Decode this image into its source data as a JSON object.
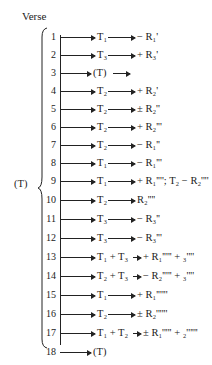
{
  "title": "Verse",
  "group_label": "(T)",
  "rows": [
    {
      "n": "1",
      "term": "T₁",
      "result": "− R₁'"
    },
    {
      "n": "2",
      "term": "T₃",
      "result": "+ R₃'"
    },
    {
      "n": "3",
      "term": "(T)",
      "result": ""
    },
    {
      "n": "4",
      "term": "T₂",
      "result": "+ R₂'"
    },
    {
      "n": "5",
      "term": "T₂",
      "result": "± R₂''"
    },
    {
      "n": "6",
      "term": "T₂",
      "result": "+ R₂'''"
    },
    {
      "n": "7",
      "term": "T₂",
      "result": "− R₁''"
    },
    {
      "n": "8",
      "term": "T₁",
      "result": "− R₁'''"
    },
    {
      "n": "9",
      "term": "T₁",
      "result": "+ R₁''''; T₂ − R₂''''"
    },
    {
      "n": "10",
      "term": "T₂",
      "result": "R₂''''"
    },
    {
      "n": "11",
      "term": "T₃",
      "result": "− R₃''"
    },
    {
      "n": "12",
      "term": "T₃",
      "result": "− R₃'''"
    },
    {
      "n": "13",
      "term": "T₁ + T₃",
      "result": "+ R₁''''' + ₃''''"
    },
    {
      "n": "14",
      "term": "T₂ + T₃",
      "result": "− R₂''''' + ₃''''"
    },
    {
      "n": "15",
      "term": "T₁",
      "result": "+ R₁''''''"
    },
    {
      "n": "16",
      "term": "T₂",
      "result": "± R₂''''''"
    },
    {
      "n": "17",
      "term": "T₁ + T₂",
      "result": "± R₁''''' + ₂''''''"
    },
    {
      "n": "18",
      "term": "(T)",
      "result": ""
    }
  ]
}
